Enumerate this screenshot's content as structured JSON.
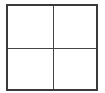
{
  "diagram": {
    "type": "grid",
    "rows": 2,
    "columns": 2,
    "cells": [
      {
        "row": 0,
        "col": 0,
        "label": ""
      },
      {
        "row": 0,
        "col": 1,
        "label": ""
      },
      {
        "row": 1,
        "col": 0,
        "label": ""
      },
      {
        "row": 1,
        "col": 1,
        "label": ""
      }
    ],
    "colors": {
      "border": "#3a3a3a",
      "divider": "#444444",
      "background": "#ffffff"
    }
  }
}
